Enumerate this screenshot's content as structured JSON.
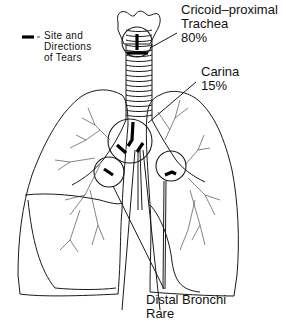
{
  "legend": {
    "symbol": "tear-marker",
    "separator": "=",
    "text_lines": [
      "Site and",
      "Directions",
      "of Tears"
    ]
  },
  "callouts": [
    {
      "id": "cricoid",
      "lines": [
        "Cricoid–proximal",
        "Trachea",
        "80%"
      ]
    },
    {
      "id": "carina",
      "lines": [
        "Carina",
        "15%"
      ]
    },
    {
      "id": "distal",
      "lines": [
        "Distal Bronchi",
        "Rare"
      ]
    }
  ],
  "colors": {
    "ink": "#1a1a1a",
    "background": "#ffffff"
  }
}
